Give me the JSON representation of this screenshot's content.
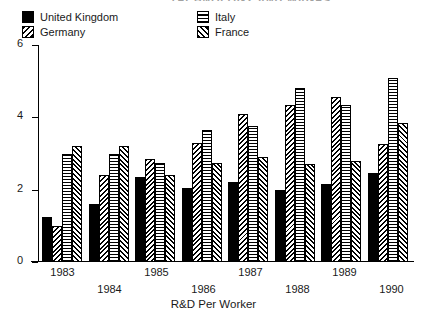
{
  "chart_data": {
    "type": "bar",
    "title": "TECHNOLOGY AND WAGES",
    "subtitle": "",
    "xlabel": "R&D Per Worker",
    "ylabel": "",
    "categories": [
      "1983",
      "1984",
      "1985",
      "1986",
      "1987",
      "1988",
      "1989",
      "1990"
    ],
    "series": [
      {
        "name": "United Kingdom",
        "pattern": "solid-black",
        "values": [
          1.25,
          1.6,
          2.35,
          2.05,
          2.2,
          2.0,
          2.15,
          2.45
        ]
      },
      {
        "name": "Germany",
        "pattern": "back-hatch",
        "values": [
          1.0,
          2.4,
          2.85,
          3.3,
          4.1,
          4.35,
          4.55,
          3.25
        ]
      },
      {
        "name": "Italy",
        "pattern": "horizontal-lines",
        "values": [
          3.0,
          3.0,
          2.75,
          3.65,
          3.75,
          4.8,
          4.35,
          5.1
        ]
      },
      {
        "name": "France",
        "pattern": "forward-hatch",
        "values": [
          3.2,
          3.2,
          2.4,
          2.75,
          2.9,
          2.7,
          2.8,
          3.85
        ]
      }
    ],
    "ylim": [
      0,
      6
    ],
    "yticks": [
      0,
      2,
      4,
      6
    ],
    "ytick_labels": [
      "0",
      "2",
      "4",
      "6"
    ],
    "grid": false,
    "legend_position": "top",
    "legend_entries": [
      "United Kingdom",
      "Germany",
      "Italy",
      "France"
    ],
    "colors": {
      "foreground": "#000000",
      "background": "#ffffff"
    }
  }
}
